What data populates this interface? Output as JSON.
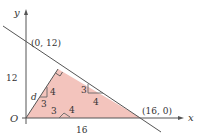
{
  "diagram": {
    "type": "coordinate-geometry",
    "colors": {
      "fill": "#f3c4bd",
      "line": "#555555",
      "text": "#333333",
      "background": "#ffffff"
    },
    "axes": {
      "x_label": "x",
      "y_label": "y",
      "origin_label": "O"
    },
    "points": {
      "y_intercept": "(0, 12)",
      "x_intercept": "(16, 0)"
    },
    "lengths": {
      "vertical_leg": "12",
      "horizontal_leg": "16",
      "distance": "d"
    },
    "small_triangles": [
      {
        "name": "perpendicular-triangle",
        "short_leg": "3",
        "long_leg": "4"
      },
      {
        "name": "hypotenuse-triangle",
        "short_leg": "3",
        "long_leg": "4"
      },
      {
        "name": "base-triangle",
        "short_leg": "3",
        "long_leg": "4"
      }
    ],
    "side_label_3": "3"
  }
}
